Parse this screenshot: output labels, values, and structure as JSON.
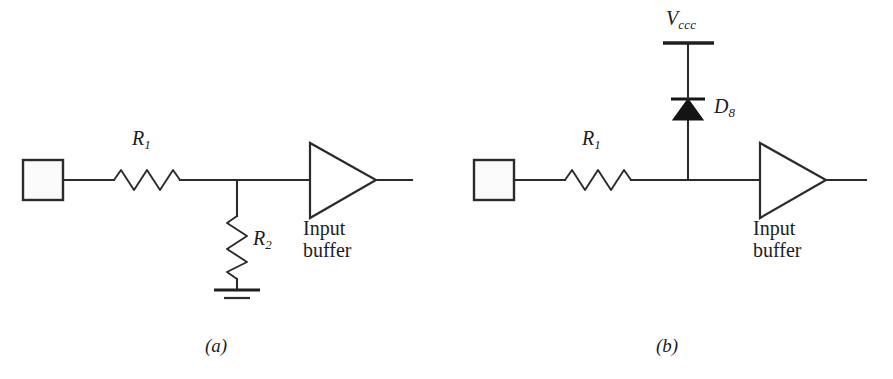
{
  "figure": {
    "type": "circuit-diagram",
    "background_color": "#ffffff",
    "line_color": "#2b2b2b"
  },
  "circuits": [
    {
      "id": "a",
      "caption": "(a)",
      "terminal": {
        "name": "input-terminal",
        "shape": "square",
        "label": ""
      },
      "series_resistor": {
        "label": "R",
        "subscript": "1"
      },
      "shunt_resistor": {
        "label": "R",
        "subscript": "2"
      },
      "ground": {
        "symbol": "earth-ground",
        "bars": 2
      },
      "buffer": {
        "line1": "Input",
        "line2": "buffer",
        "shape": "triangle"
      }
    },
    {
      "id": "b",
      "caption": "(b)",
      "terminal": {
        "name": "input-terminal",
        "shape": "square",
        "label": ""
      },
      "series_resistor": {
        "label": "R",
        "subscript": "1"
      },
      "supply_rail": {
        "label": "V",
        "subscript": "ccc"
      },
      "diode": {
        "label": "D",
        "subscript": "8",
        "orientation": "anode-down"
      },
      "buffer": {
        "line1": "Input",
        "line2": "buffer",
        "shape": "triangle"
      }
    }
  ]
}
